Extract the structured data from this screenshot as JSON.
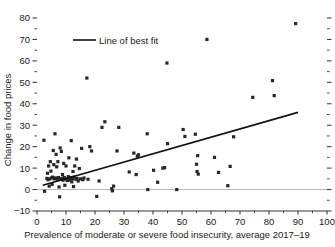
{
  "chart_data": {
    "type": "scatter",
    "title": "",
    "xlabel": "Prevalence of moderate or severe food insecurity, average 2017–19",
    "ylabel": "Change in food prices",
    "xlim": [
      0,
      100
    ],
    "ylim": [
      -10,
      80
    ],
    "xticks": [
      0,
      10,
      20,
      30,
      40,
      50,
      60,
      70,
      80,
      90,
      100
    ],
    "xticklabels": [
      "0",
      "10",
      "20",
      "30",
      "40",
      "50",
      "60",
      "70",
      "80",
      "90",
      "100"
    ],
    "yticks": [
      -10,
      0,
      10,
      20,
      30,
      40,
      50,
      60,
      70,
      80
    ],
    "yticklabels": [
      "−10",
      "0",
      "10",
      "20",
      "30",
      "40",
      "50",
      "60",
      "70",
      "80"
    ],
    "minor_ticks": true,
    "grid": false,
    "zero_reference_line": 0,
    "legend": {
      "position": "top-left-inside",
      "entries": [
        {
          "label": "Line of best fit",
          "type": "line",
          "color": "#111111"
        }
      ]
    },
    "series": [
      {
        "name": "Countries",
        "type": "scatter",
        "marker": "square",
        "color": "#262626",
        "points": [
          [
            2.4,
            23.0
          ],
          [
            2.6,
            -0.8
          ],
          [
            3.4,
            5.2
          ],
          [
            3.6,
            7.6
          ],
          [
            3.8,
            4.6
          ],
          [
            4.0,
            11.0
          ],
          [
            4.2,
            1.6
          ],
          [
            4.4,
            5.0
          ],
          [
            4.6,
            13.0
          ],
          [
            4.8,
            8.6
          ],
          [
            5.0,
            5.4
          ],
          [
            5.2,
            2.4
          ],
          [
            5.4,
            5.8
          ],
          [
            5.6,
            18.2
          ],
          [
            5.8,
            11.6
          ],
          [
            6.0,
            5.0
          ],
          [
            6.2,
            26.0
          ],
          [
            6.4,
            5.4
          ],
          [
            6.6,
            16.4
          ],
          [
            6.8,
            10.6
          ],
          [
            7.0,
            4.8
          ],
          [
            7.2,
            13.0
          ],
          [
            7.4,
            5.6
          ],
          [
            7.6,
            1.2
          ],
          [
            7.8,
            -3.4
          ],
          [
            8.0,
            19.4
          ],
          [
            8.2,
            5.0
          ],
          [
            8.4,
            17.8
          ],
          [
            8.6,
            5.2
          ],
          [
            8.8,
            7.0
          ],
          [
            9.0,
            4.4
          ],
          [
            9.2,
            12.2
          ],
          [
            9.4,
            5.6
          ],
          [
            9.6,
            2.0
          ],
          [
            9.8,
            5.0
          ],
          [
            10.0,
            11.0
          ],
          [
            10.4,
            4.2
          ],
          [
            10.8,
            6.0
          ],
          [
            11.0,
            14.8
          ],
          [
            11.2,
            4.4
          ],
          [
            11.6,
            5.6
          ],
          [
            11.8,
            22.8
          ],
          [
            12.0,
            3.6
          ],
          [
            12.2,
            5.0
          ],
          [
            12.4,
            8.4
          ],
          [
            12.6,
            1.4
          ],
          [
            12.8,
            5.8
          ],
          [
            13.0,
            11.0
          ],
          [
            13.4,
            4.8
          ],
          [
            13.6,
            14.2
          ],
          [
            13.8,
            5.2
          ],
          [
            14.2,
            4.0
          ],
          [
            14.6,
            9.8
          ],
          [
            15.0,
            5.0
          ],
          [
            15.4,
            19.2
          ],
          [
            15.8,
            4.6
          ],
          [
            16.2,
            5.4
          ],
          [
            17.2,
            52.0
          ],
          [
            17.6,
            4.8
          ],
          [
            18.2,
            20.0
          ],
          [
            18.8,
            18.0
          ],
          [
            20.6,
            -3.2
          ],
          [
            21.4,
            4.0
          ],
          [
            22.4,
            29.0
          ],
          [
            23.4,
            31.6
          ],
          [
            25.8,
            0.4
          ],
          [
            26.0,
            -0.6
          ],
          [
            26.4,
            1.6
          ],
          [
            27.6,
            18.0
          ],
          [
            28.2,
            29.0
          ],
          [
            31.8,
            8.2
          ],
          [
            33.4,
            17.0
          ],
          [
            34.2,
            7.0
          ],
          [
            34.6,
            15.6
          ],
          [
            35.0,
            16.2
          ],
          [
            38.0,
            26.0
          ],
          [
            38.2,
            0.0
          ],
          [
            40.2,
            9.0
          ],
          [
            41.6,
            3.4
          ],
          [
            43.4,
            10.0
          ],
          [
            44.0,
            10.2
          ],
          [
            44.8,
            59.0
          ],
          [
            45.0,
            21.4
          ],
          [
            48.2,
            0.0
          ],
          [
            50.4,
            28.0
          ],
          [
            51.0,
            24.8
          ],
          [
            54.6,
            25.8
          ],
          [
            55.0,
            11.8
          ],
          [
            55.2,
            8.4
          ],
          [
            55.4,
            15.8
          ],
          [
            55.6,
            7.2
          ],
          [
            58.6,
            70.0
          ],
          [
            61.2,
            15.0
          ],
          [
            62.6,
            8.0
          ],
          [
            65.8,
            1.8
          ],
          [
            66.6,
            10.8
          ],
          [
            67.8,
            24.6
          ],
          [
            74.4,
            43.0
          ],
          [
            81.2,
            50.8
          ],
          [
            81.8,
            43.8
          ],
          [
            89.2,
            77.4
          ]
        ]
      }
    ],
    "fit_line": {
      "name": "Line of best fit",
      "x_start": 2.0,
      "y_start": 2.0,
      "x_end": 90.0,
      "y_end": 36.0,
      "color": "#111111"
    }
  }
}
